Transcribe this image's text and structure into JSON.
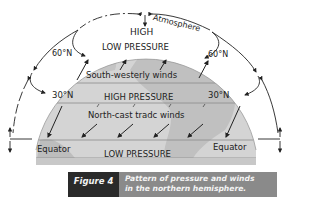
{
  "diagram": {
    "labels": {
      "atmosphere": "Atmosphere",
      "high_top": "HIGH",
      "low_pressure_60": "LOW PRESSURE",
      "south_westerly": "South-westerly winds",
      "lat60_left": "60°N",
      "lat60_right": "60°N",
      "lat30_left": "30°N",
      "lat30_right": "30°N",
      "high_pressure_30": "HIGH PRESSURE",
      "north_east_trade": "North-cast tradc winds",
      "equator_left": "Equator",
      "equator_right": "Equator",
      "low_pressure_eq": "LOW PRESSURE"
    },
    "colors": {
      "globe_light": "#d8d8d8",
      "globe_mid": "#bdbdbd",
      "band_line": "#8a8a8a",
      "arrow": "#222222"
    }
  },
  "caption": {
    "figure_label": "Figure 4",
    "line1": "Pattern of pressure and winds",
    "line2": "in the northern hemisphere.",
    "colors": {
      "label_bg": "#2a2a2a",
      "text_bg": "#8a8a8a"
    }
  }
}
